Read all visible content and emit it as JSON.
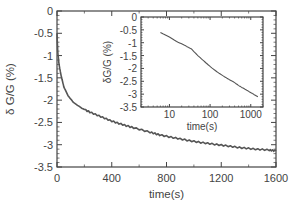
{
  "chart_data": [
    {
      "id": "main",
      "type": "line",
      "title": "",
      "xlabel": "time(s)",
      "ylabel": "δ G/G (%)",
      "xlim": [
        0,
        1600
      ],
      "ylim": [
        -3.5,
        0
      ],
      "x_ticks": [
        "0",
        "400",
        "800",
        "1200",
        "1600"
      ],
      "y_ticks": [
        "0",
        "-0.5",
        "-1",
        "-1.5",
        "-2",
        "-2.5",
        "-3",
        "-3.5"
      ],
      "grid": false,
      "series": [
        {
          "name": "δG/G",
          "color": "#555555",
          "x": [
            0,
            5,
            15,
            30,
            50,
            80,
            120,
            180,
            240,
            320,
            400,
            480,
            560,
            680,
            750,
            850,
            950,
            1050,
            1150,
            1250,
            1350,
            1450,
            1550,
            1600
          ],
          "y": [
            -0.5,
            -0.9,
            -1.2,
            -1.45,
            -1.7,
            -1.9,
            -2.05,
            -2.18,
            -2.27,
            -2.37,
            -2.47,
            -2.55,
            -2.62,
            -2.72,
            -2.78,
            -2.84,
            -2.9,
            -2.95,
            -2.99,
            -3.03,
            -3.07,
            -3.1,
            -3.12,
            -3.14
          ]
        }
      ]
    },
    {
      "id": "inset",
      "type": "line",
      "title": "",
      "xlabel": "time(s)",
      "ylabel": "δG/G (%)",
      "xscale": "log",
      "xlim": [
        2,
        2000
      ],
      "ylim": [
        -3.5,
        0
      ],
      "x_ticks": [
        "10",
        "100",
        "1000"
      ],
      "y_ticks": [
        "0",
        "-0.5",
        "-1",
        "-1.5",
        "-2",
        "-2.5",
        "-3",
        "-3.5"
      ],
      "grid": false,
      "series": [
        {
          "name": "δG/G",
          "color": "#555555",
          "x": [
            6,
            10,
            15,
            25,
            35,
            50,
            75,
            110,
            170,
            260,
            400,
            520,
            800,
            1100,
            1500
          ],
          "y": [
            -0.6,
            -0.78,
            -0.95,
            -1.12,
            -1.25,
            -1.5,
            -1.75,
            -1.98,
            -2.2,
            -2.38,
            -2.55,
            -2.68,
            -2.85,
            -2.98,
            -3.1
          ]
        }
      ]
    }
  ]
}
